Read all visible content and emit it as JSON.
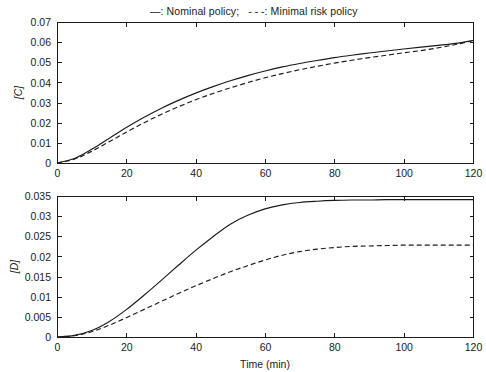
{
  "legend": {
    "solid_marker": "—",
    "solid_label": ": Nominal policy;",
    "dashed_marker": "- - -",
    "dashed_label": ": Minimal risk policy"
  },
  "chart_data": [
    {
      "type": "line",
      "title": "",
      "xlabel": "",
      "ylabel": "[C]",
      "xlim": [
        0,
        120
      ],
      "ylim": [
        0,
        0.07
      ],
      "xticks": [
        0,
        20,
        40,
        60,
        80,
        100,
        120
      ],
      "yticks": [
        0,
        0.01,
        0.02,
        0.03,
        0.04,
        0.05,
        0.06,
        0.07
      ],
      "xticklabels": [
        "0",
        "20",
        "40",
        "60",
        "80",
        "100",
        "120"
      ],
      "yticklabels": [
        "0",
        "0.01",
        "0.02",
        "0.03",
        "0.04",
        "0.05",
        "0.06",
        "0.07"
      ],
      "grid": false,
      "legend_position": "above-figure",
      "x": [
        0,
        5,
        10,
        15,
        20,
        25,
        30,
        35,
        40,
        45,
        50,
        55,
        60,
        65,
        70,
        75,
        80,
        85,
        90,
        95,
        100,
        105,
        110,
        115,
        120
      ],
      "series": [
        {
          "name": "Nominal policy",
          "style": "solid",
          "values": [
            0.0,
            0.0022,
            0.0068,
            0.0122,
            0.0176,
            0.0226,
            0.0271,
            0.0311,
            0.0347,
            0.0379,
            0.0408,
            0.0434,
            0.0457,
            0.0477,
            0.0494,
            0.0509,
            0.0523,
            0.0535,
            0.0546,
            0.0556,
            0.0566,
            0.0575,
            0.0584,
            0.0594,
            0.0608
          ]
        },
        {
          "name": "Minimal risk policy",
          "style": "dashed",
          "values": [
            0.0,
            0.0019,
            0.0058,
            0.0105,
            0.0153,
            0.0199,
            0.0241,
            0.0279,
            0.0314,
            0.0345,
            0.0373,
            0.0399,
            0.0423,
            0.0444,
            0.0463,
            0.048,
            0.0496,
            0.051,
            0.0523,
            0.0535,
            0.0547,
            0.0558,
            0.0572,
            0.0588,
            0.0608
          ]
        }
      ]
    },
    {
      "type": "line",
      "title": "",
      "xlabel": "Time (min)",
      "ylabel": "[D]",
      "xlim": [
        0,
        120
      ],
      "ylim": [
        0,
        0.035
      ],
      "xticks": [
        0,
        20,
        40,
        60,
        80,
        100,
        120
      ],
      "yticks": [
        0,
        0.005,
        0.01,
        0.015,
        0.02,
        0.025,
        0.03,
        0.035
      ],
      "xticklabels": [
        "0",
        "20",
        "40",
        "60",
        "80",
        "100",
        "120"
      ],
      "yticklabels": [
        "0",
        "0.005",
        "0.01",
        "0.015",
        "0.02",
        "0.025",
        "0.03",
        "0.035"
      ],
      "grid": false,
      "legend_position": "above-figure",
      "x": [
        0,
        5,
        10,
        15,
        20,
        25,
        30,
        35,
        40,
        45,
        50,
        55,
        60,
        65,
        70,
        75,
        80,
        85,
        90,
        95,
        100,
        105,
        110,
        115,
        120
      ],
      "series": [
        {
          "name": "Nominal policy",
          "style": "solid",
          "values": [
            0.0,
            0.0004,
            0.0016,
            0.0038,
            0.0068,
            0.0103,
            0.014,
            0.0178,
            0.0215,
            0.0249,
            0.028,
            0.0302,
            0.0318,
            0.0328,
            0.0334,
            0.0337,
            0.0339,
            0.034,
            0.034,
            0.0341,
            0.0341,
            0.0341,
            0.0341,
            0.0341,
            0.0341
          ]
        },
        {
          "name": "Minimal risk policy",
          "style": "dashed",
          "values": [
            0.0,
            0.0003,
            0.0013,
            0.0029,
            0.0048,
            0.0068,
            0.0088,
            0.0108,
            0.0127,
            0.0145,
            0.0162,
            0.0177,
            0.0191,
            0.0203,
            0.0212,
            0.0218,
            0.0222,
            0.0225,
            0.0226,
            0.0227,
            0.0228,
            0.0228,
            0.0228,
            0.0228,
            0.0228
          ]
        }
      ]
    }
  ]
}
